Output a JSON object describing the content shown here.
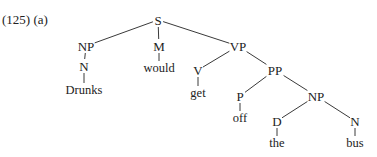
{
  "example": {
    "number": "(125)",
    "sub": "(a)",
    "label": "(125) (a)"
  },
  "tree": {
    "nodes": [
      {
        "id": "S",
        "label": "S",
        "type": "phrase",
        "x": 158,
        "y": 20
      },
      {
        "id": "NP1",
        "label": "NP",
        "type": "phrase",
        "x": 86,
        "y": 46
      },
      {
        "id": "N1",
        "label": "N",
        "type": "category",
        "x": 84,
        "y": 66
      },
      {
        "id": "W1",
        "label": "Drunks",
        "type": "word",
        "x": 84,
        "y": 90
      },
      {
        "id": "M",
        "label": "M",
        "type": "category",
        "x": 159,
        "y": 46
      },
      {
        "id": "W2",
        "label": "would",
        "type": "word",
        "x": 159,
        "y": 68
      },
      {
        "id": "VP",
        "label": "VP",
        "type": "phrase",
        "x": 238,
        "y": 46
      },
      {
        "id": "V",
        "label": "V",
        "type": "category",
        "x": 198,
        "y": 70
      },
      {
        "id": "W3",
        "label": "get",
        "type": "word",
        "x": 198,
        "y": 93
      },
      {
        "id": "PP",
        "label": "PP",
        "type": "phrase",
        "x": 275,
        "y": 70
      },
      {
        "id": "P",
        "label": "P",
        "type": "category",
        "x": 240,
        "y": 96
      },
      {
        "id": "W4",
        "label": "off",
        "type": "word",
        "x": 240,
        "y": 118
      },
      {
        "id": "NP2",
        "label": "NP",
        "type": "phrase",
        "x": 316,
        "y": 96
      },
      {
        "id": "D",
        "label": "D",
        "type": "category",
        "x": 277,
        "y": 121
      },
      {
        "id": "W5",
        "label": "the",
        "type": "word",
        "x": 277,
        "y": 143
      },
      {
        "id": "N2",
        "label": "N",
        "type": "category",
        "x": 355,
        "y": 121
      },
      {
        "id": "W6",
        "label": "bus",
        "type": "word",
        "x": 355,
        "y": 143
      }
    ],
    "edges": [
      [
        "S",
        "NP1"
      ],
      [
        "S",
        "M"
      ],
      [
        "S",
        "VP"
      ],
      [
        "NP1",
        "N1"
      ],
      [
        "N1",
        "W1"
      ],
      [
        "M",
        "W2"
      ],
      [
        "VP",
        "V"
      ],
      [
        "VP",
        "PP"
      ],
      [
        "V",
        "W3"
      ],
      [
        "PP",
        "P"
      ],
      [
        "PP",
        "NP2"
      ],
      [
        "P",
        "W4"
      ],
      [
        "NP2",
        "D"
      ],
      [
        "NP2",
        "N2"
      ],
      [
        "D",
        "W5"
      ],
      [
        "N2",
        "W6"
      ]
    ],
    "sentence": "Drunks would get off the bus"
  },
  "colors": {
    "background": "#ffffff",
    "text": "#222222",
    "edge": "#3a3a3a"
  }
}
